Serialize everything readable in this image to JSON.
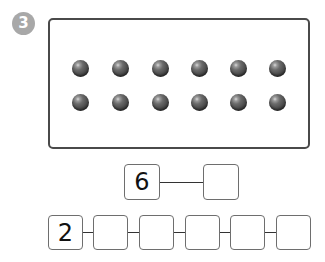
{
  "problem": {
    "number": "3",
    "badge_color": "#a8a8a8"
  },
  "dot_panel": {
    "rows": 2,
    "columns": 6,
    "total_dots": 12,
    "dot_color": "#4f4f4f"
  },
  "top_chain": {
    "boxes": [
      "6",
      ""
    ]
  },
  "bottom_chain": {
    "boxes": [
      "2",
      "",
      "",
      "",
      "",
      ""
    ]
  }
}
